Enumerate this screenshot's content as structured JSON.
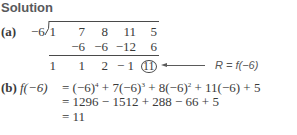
{
  "heading": "Solution",
  "part_a": {
    "label": "(a)",
    "divisor": "−6",
    "row1": [
      "1",
      "7",
      "8",
      "11",
      "5"
    ],
    "row2": [
      "",
      "−6",
      "−6",
      "−12",
      "6"
    ],
    "row3": [
      "1",
      "1",
      "2",
      "− 1",
      "11"
    ],
    "remainder_annotation": "R = f(−6)",
    "arrow_icon": "left-arrow"
  },
  "part_b": {
    "label": "(b)",
    "line1_lhs": "f(−6)",
    "line1_rhs_parts": [
      "= (−6)",
      "4",
      " + 7(−6)",
      "3",
      " + 8(−6)",
      "2",
      " + 11(−6) + 5"
    ],
    "line2": "= 1296 − 1512 + 288 − 66 + 5",
    "line3": "= 11"
  }
}
